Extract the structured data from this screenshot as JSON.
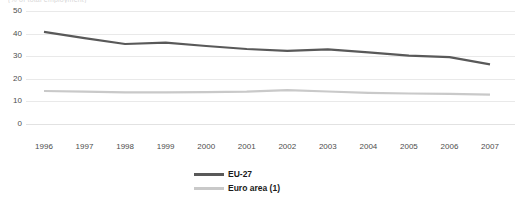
{
  "top_caption_fragment": "(% of total employment)",
  "legend": {
    "items": [
      {
        "label": "EU-27",
        "color": "#595959",
        "swatch_name": "legend-swatch-eu-27"
      },
      {
        "label": "Euro area (1)",
        "color": "#c9c9c9",
        "swatch_name": "legend-swatch-euro-area"
      }
    ]
  },
  "chart_data": {
    "type": "line",
    "title": "",
    "subtitle": "",
    "xlabel": "",
    "ylabel": "",
    "categories": [
      "1996",
      "1997",
      "1998",
      "1999",
      "2000",
      "2001",
      "2002",
      "2003",
      "2004",
      "2005",
      "2006",
      "2007"
    ],
    "x": [
      1996,
      1997,
      1998,
      1999,
      2000,
      2001,
      2002,
      2003,
      2004,
      2005,
      2006,
      2007
    ],
    "ylim": [
      0,
      50
    ],
    "yticks": [
      0,
      10,
      20,
      30,
      40,
      50
    ],
    "ytick_labels": [
      "0",
      "10",
      "20",
      "30",
      "40",
      "50"
    ],
    "grid": true,
    "grid_axis": "y",
    "legend_position": "bottom",
    "series": [
      {
        "name": "EU-27",
        "color": "#595959",
        "width": 2.2,
        "values": [
          40.8,
          38.0,
          35.4,
          36.0,
          34.5,
          33.2,
          32.4,
          33.0,
          31.7,
          30.2,
          29.6,
          26.4
        ]
      },
      {
        "name": "Euro area (1)",
        "color": "#c9c9c9",
        "width": 2.2,
        "values": [
          14.6,
          14.3,
          14.0,
          14.0,
          14.1,
          14.3,
          15.0,
          14.4,
          13.8,
          13.5,
          13.3,
          13.0
        ]
      }
    ]
  }
}
